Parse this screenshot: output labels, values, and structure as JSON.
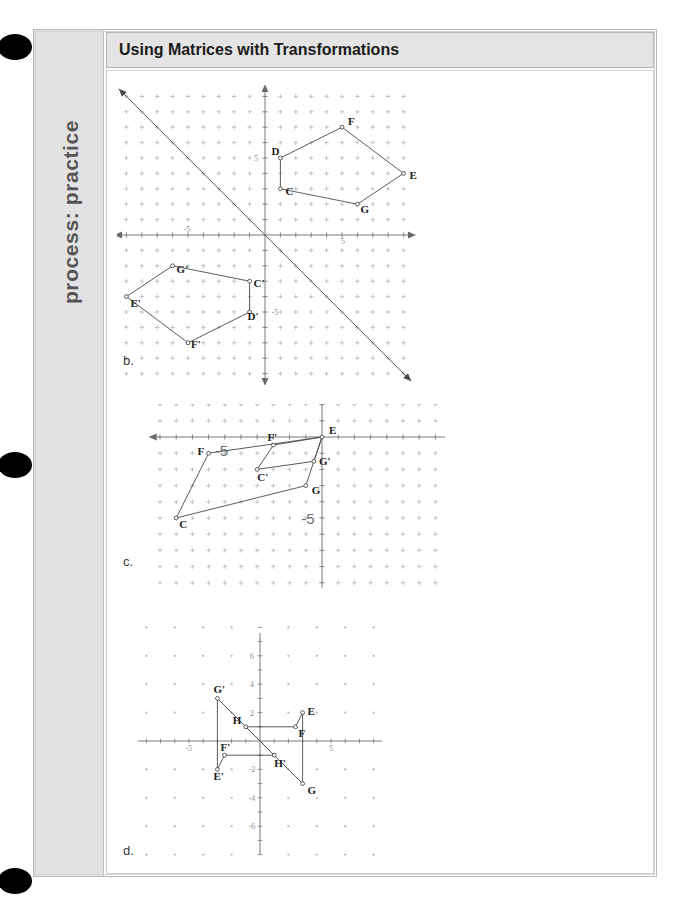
{
  "page": {
    "sidebar_label": "process: practice",
    "header_title": "Using Matrices with Transformations",
    "binding_holes": 3
  },
  "figures": [
    {
      "letter": "b.",
      "description": "Pentagon CDFEG in quadrant I with its 180 degree rotation image C'D'F'E'G' in quadrant III, and the line y = -x drawn through the origin.",
      "axis_labels": {
        "x_neg": "-5",
        "x_pos": "5",
        "y_pos": "5",
        "y_neg": "-5"
      },
      "points": [
        {
          "label": "C",
          "x": 1,
          "y": 3
        },
        {
          "label": "D",
          "x": 1,
          "y": 5
        },
        {
          "label": "F",
          "x": 5,
          "y": 7
        },
        {
          "label": "E",
          "x": 9,
          "y": 4
        },
        {
          "label": "G",
          "x": 6,
          "y": 2
        },
        {
          "label": "C'",
          "x": -1,
          "y": -3
        },
        {
          "label": "D'",
          "x": -1,
          "y": -5
        },
        {
          "label": "F'",
          "x": -5,
          "y": -7
        },
        {
          "label": "E'",
          "x": -9,
          "y": -4
        },
        {
          "label": "G'",
          "x": -6,
          "y": -2
        }
      ],
      "polygons": [
        {
          "name": "preimage",
          "vertices": [
            "C",
            "D",
            "F",
            "E",
            "G"
          ]
        },
        {
          "name": "image",
          "vertices": [
            "C'",
            "D'",
            "F'",
            "E'",
            "G'"
          ]
        }
      ],
      "lines": [
        {
          "name": "y=-x",
          "from": [
            -9.5,
            9.5
          ],
          "to": [
            9.5,
            -9.5
          ],
          "arrows": "both"
        }
      ]
    },
    {
      "letter": "c.",
      "description": "Quadrilateral CFEG and its smaller image C'F'E'G' sharing vertex E at the origin; horizontal shear / stretch image.",
      "axis_labels": {
        "x_neg": "-5",
        "y_neg": "-5"
      },
      "points": [
        {
          "label": "C",
          "x": -9,
          "y": -5
        },
        {
          "label": "F",
          "x": -7,
          "y": -1
        },
        {
          "label": "E",
          "x": 0,
          "y": 0
        },
        {
          "label": "G",
          "x": -1,
          "y": -3
        },
        {
          "label": "C'",
          "x": -4,
          "y": -2
        },
        {
          "label": "F'",
          "x": -3,
          "y": -0.5
        },
        {
          "label": "G'",
          "x": -0.5,
          "y": -1.5
        }
      ],
      "polygons": [
        {
          "name": "preimage",
          "vertices": [
            "C",
            "F",
            "E",
            "G"
          ]
        },
        {
          "name": "image",
          "vertices": [
            "C'",
            "F'",
            "E",
            "G'"
          ]
        }
      ]
    },
    {
      "letter": "d.",
      "description": "Quadrilateral EFHG and its 180 degree rotation image E'F'H'G' about the origin.",
      "axis_labels": {
        "x_neg": "-5",
        "x_pos": "5",
        "y_ticks": [
          "6",
          "4",
          "2",
          "-2",
          "-4",
          "-6"
        ]
      },
      "points": [
        {
          "label": "E",
          "x": 3,
          "y": 2
        },
        {
          "label": "F",
          "x": 2.5,
          "y": 1
        },
        {
          "label": "H",
          "x": -1,
          "y": 1
        },
        {
          "label": "G",
          "x": 3,
          "y": -3
        },
        {
          "label": "E'",
          "x": -3,
          "y": -2
        },
        {
          "label": "F'",
          "x": -2.5,
          "y": -1
        },
        {
          "label": "H'",
          "x": 1,
          "y": -1
        },
        {
          "label": "G'",
          "x": -3,
          "y": 3
        }
      ],
      "polygons": [
        {
          "name": "preimage",
          "vertices": [
            "E",
            "F",
            "H",
            "G"
          ]
        },
        {
          "name": "image",
          "vertices": [
            "E'",
            "F'",
            "H'",
            "G'"
          ]
        }
      ]
    }
  ],
  "colors": {
    "header_bg": "#e4e4e4",
    "sidebar_bg": "#e2e2e2",
    "sidebar_text": "#555555",
    "page_bg": "#ffffff",
    "grid": "#b6b6b6",
    "axis": "#6a6a6a",
    "stroke": "#4a4a4a",
    "hole": "#000000"
  }
}
